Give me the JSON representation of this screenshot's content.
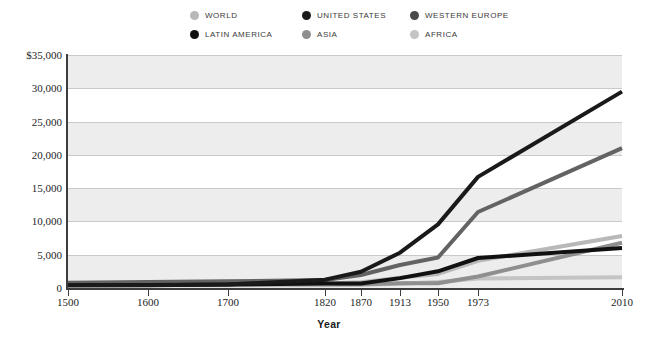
{
  "chart_data": {
    "type": "line",
    "title": "",
    "subtitle": "",
    "xlabel": "Year",
    "ylabel": "",
    "grid": true,
    "legend_position": "top",
    "ylim": [
      0,
      35000
    ],
    "yticks": [
      0,
      5000,
      10000,
      15000,
      20000,
      25000,
      30000,
      35000
    ],
    "ytick_labels": [
      "0",
      "5,000",
      "10,000",
      "15,000",
      "20,000",
      "25,000",
      "30,000",
      "$35,000"
    ],
    "categories": [
      "1500",
      "1600",
      "1700",
      "1820",
      "1870",
      "1913",
      "1950",
      "1973",
      "2010"
    ],
    "x_positions_px": [
      68,
      148,
      228,
      325,
      361,
      400,
      438,
      478,
      622
    ],
    "series": [
      {
        "name": "WORLD",
        "color": "#b8b8b8",
        "values": [
          566,
          596,
          616,
          667,
          870,
          1524,
          2111,
          4091,
          7814
        ]
      },
      {
        "name": "UNITED STATES",
        "color": "#1a1a1a",
        "values": [
          400,
          400,
          527,
          1257,
          2445,
          5301,
          9561,
          16689,
          29500
        ]
      },
      {
        "name": "WESTERN EUROPE",
        "color": "#636363",
        "values": [
          771,
          889,
          997,
          1202,
          1960,
          3457,
          4579,
          11416,
          21000
        ]
      },
      {
        "name": "LATIN AMERICA",
        "color": "#111111",
        "values": [
          416,
          438,
          527,
          691,
          676,
          1481,
          2506,
          4504,
          6000
        ]
      },
      {
        "name": "ASIA",
        "color": "#8f8f8f",
        "values": [
          572,
          575,
          571,
          581,
          556,
          696,
          717,
          1718,
          6800
        ]
      },
      {
        "name": "AFRICA",
        "color": "#c4c4c4",
        "values": [
          414,
          422,
          421,
          420,
          500,
          637,
          890,
          1410,
          1600
        ]
      }
    ]
  },
  "legend": {
    "items": [
      {
        "label": "WORLD",
        "color": "#b8b8b8"
      },
      {
        "label": "UNITED STATES",
        "color": "#1a1a1a"
      },
      {
        "label": "WESTERN EUROPE",
        "color": "#4a4a4a"
      },
      {
        "label": "LATIN AMERICA",
        "color": "#111111"
      },
      {
        "label": "ASIA",
        "color": "#8f8f8f"
      },
      {
        "label": "AFRICA",
        "color": "#c4c4c4"
      }
    ]
  },
  "axis": {
    "x_title": "Year"
  }
}
